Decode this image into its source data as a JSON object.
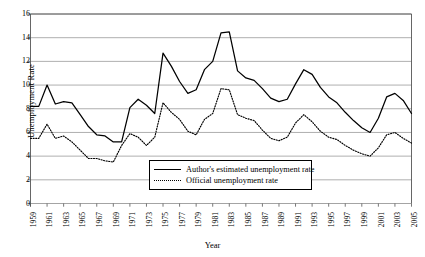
{
  "chart_data": {
    "type": "line",
    "title": "",
    "xlabel": "Year",
    "ylabel": "Unemployment Rate",
    "ylim": [
      0,
      16
    ],
    "yticks": [
      0,
      2,
      4,
      6,
      8,
      10,
      12,
      14,
      16
    ],
    "xlim": [
      1959,
      2005
    ],
    "grid": "horizontal",
    "legend_position": "inside-bottom-center",
    "x": [
      1959,
      1960,
      1961,
      1962,
      1963,
      1964,
      1965,
      1966,
      1967,
      1968,
      1969,
      1970,
      1971,
      1972,
      1973,
      1974,
      1975,
      1976,
      1977,
      1978,
      1979,
      1980,
      1981,
      1982,
      1983,
      1984,
      1985,
      1986,
      1987,
      1988,
      1989,
      1990,
      1991,
      1992,
      1993,
      1994,
      1995,
      1996,
      1997,
      1998,
      1999,
      2000,
      2001,
      2002,
      2003,
      2004,
      2005
    ],
    "xticks": [
      1959,
      1961,
      1963,
      1965,
      1967,
      1969,
      1971,
      1973,
      1975,
      1977,
      1979,
      1981,
      1983,
      1985,
      1987,
      1989,
      1991,
      1993,
      1995,
      1997,
      1999,
      2001,
      2003,
      2005
    ],
    "xtick_labels": [
      "1959",
      "1961",
      "1963",
      "1965",
      "1967",
      "1969",
      "1971",
      "1973",
      "1975",
      "1977",
      "1979",
      "1981",
      "1983",
      "1985",
      "1987",
      "1989",
      "1991",
      "1993",
      "1995",
      "1997",
      "1999",
      "2001",
      "2003",
      "2005"
    ],
    "series": [
      {
        "name": "Author's estimated unemployment rate",
        "style": "solid",
        "color": "#000000",
        "values": [
          8.2,
          8.2,
          10.0,
          8.4,
          8.6,
          8.5,
          7.5,
          6.5,
          5.8,
          5.7,
          5.2,
          5.2,
          8.1,
          8.8,
          8.3,
          7.6,
          12.7,
          11.6,
          10.3,
          9.3,
          9.6,
          11.3,
          12.0,
          14.4,
          14.5,
          11.2,
          10.6,
          10.4,
          9.7,
          8.9,
          8.6,
          8.8,
          10.1,
          11.3,
          10.9,
          9.8,
          9.0,
          8.5,
          7.7,
          7.0,
          6.4,
          6.0,
          7.2,
          9.0,
          9.3,
          8.7,
          7.6
        ]
      },
      {
        "name": "Official unemployment rate",
        "style": "dotted",
        "color": "#000000",
        "values": [
          5.5,
          5.5,
          6.7,
          5.5,
          5.7,
          5.2,
          4.5,
          3.8,
          3.8,
          3.6,
          3.5,
          4.9,
          5.9,
          5.6,
          4.9,
          5.6,
          8.5,
          7.7,
          7.1,
          6.1,
          5.8,
          7.1,
          7.6,
          9.7,
          9.6,
          7.5,
          7.2,
          7.0,
          6.2,
          5.5,
          5.3,
          5.6,
          6.8,
          7.5,
          6.9,
          6.1,
          5.6,
          5.4,
          4.9,
          4.5,
          4.2,
          4.0,
          4.7,
          5.8,
          6.0,
          5.5,
          5.1
        ]
      }
    ]
  },
  "legend": {
    "entries": [
      {
        "label": "Author's estimated unemployment rate",
        "style": "solid"
      },
      {
        "label": "Official unemployment rate",
        "style": "dotted"
      }
    ]
  }
}
